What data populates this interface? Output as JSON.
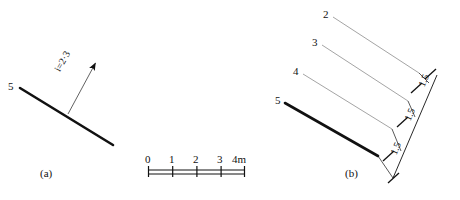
{
  "figure": {
    "background": "#ffffff",
    "ink": "#111111",
    "thin_ink": "#8a8a8a"
  },
  "panel_a": {
    "caption": "(a)",
    "line_label": "5",
    "gradient_label": "i=2·3",
    "arrow_name": "gradient-arrow",
    "main_line": {
      "x1": 20,
      "y1": 88,
      "x2": 113,
      "y2": 145,
      "stroke_width": 2.6
    },
    "leader_line": {
      "x1": 68,
      "y1": 114,
      "x2": 97,
      "y2": 62
    },
    "arrow_tip": {
      "x": 97,
      "y": 60
    }
  },
  "scale_bar": {
    "name": "scale-bar",
    "x_start": 148,
    "x_end": 245,
    "y_bar": 172,
    "ticks": [
      "0",
      "1",
      "2",
      "3"
    ],
    "end_label": "4m",
    "divisions": 4
  },
  "panel_b": {
    "caption": "(b)",
    "lines": [
      {
        "label": "2",
        "x1": 333,
        "y1": 17,
        "x2": 419,
        "y2": 73,
        "bold": false
      },
      {
        "label": "3",
        "x1": 322,
        "y1": 45,
        "x2": 408,
        "y2": 101,
        "bold": false
      },
      {
        "label": "4",
        "x1": 303,
        "y1": 74,
        "x2": 392,
        "y2": 129,
        "bold": false
      },
      {
        "label": "5",
        "x1": 285,
        "y1": 103,
        "x2": 378,
        "y2": 156,
        "bold": true
      }
    ],
    "dimension_chain": {
      "name": "dimension-chain",
      "values": [
        "1.5",
        "1.5",
        "1.5"
      ],
      "x1": 393,
      "y1": 178,
      "x2": 437,
      "y2": 75,
      "tick_style": "architectural-slash"
    }
  }
}
